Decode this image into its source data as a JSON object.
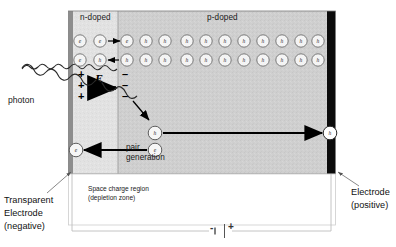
{
  "diagram": {
    "title_regions": {
      "n_doped": "n-doped",
      "p_doped": "p-doped"
    },
    "photon_label": "photon",
    "field_label": "E",
    "pair_generation_label_line1": "pair",
    "pair_generation_label_line2": "generation",
    "space_charge_line1": "Space charge region",
    "space_charge_line2": "(depletion zone)",
    "left_electrode": {
      "line1": "Transparent",
      "line2": "Electrode",
      "line3": "(negative)"
    },
    "right_electrode": {
      "line1": "Electrode",
      "line2": "(positive)"
    },
    "battery": {
      "negative": "-",
      "positive": "+"
    },
    "field_charges": {
      "positive_signs": [
        "+",
        "+",
        "+"
      ],
      "negative_signs": [
        "–",
        "–",
        "–"
      ]
    },
    "carriers_row1": [
      {
        "type": "e",
        "x": 80,
        "region": "n-doped"
      },
      {
        "type": "e",
        "x": 100,
        "region": "n-doped"
      },
      {
        "type": "e",
        "x": 127,
        "region": "p-doped"
      },
      {
        "type": "h",
        "x": 146,
        "region": "p-doped"
      },
      {
        "type": "h",
        "x": 165,
        "region": "p-doped"
      },
      {
        "type": "h",
        "x": 187,
        "region": "p-doped"
      },
      {
        "type": "h",
        "x": 206,
        "region": "p-doped"
      },
      {
        "type": "h",
        "x": 225,
        "region": "p-doped"
      },
      {
        "type": "h",
        "x": 244,
        "region": "p-doped"
      },
      {
        "type": "h",
        "x": 263,
        "region": "p-doped"
      },
      {
        "type": "h",
        "x": 282,
        "region": "p-doped"
      },
      {
        "type": "h",
        "x": 301,
        "region": "p-doped"
      },
      {
        "type": "h",
        "x": 317,
        "region": "p-doped"
      }
    ],
    "carriers_row2": [
      {
        "type": "e",
        "x": 80,
        "region": "n-doped"
      },
      {
        "type": "h",
        "x": 100,
        "region": "n-doped"
      },
      {
        "type": "h",
        "x": 127,
        "region": "p-doped"
      },
      {
        "type": "h",
        "x": 146,
        "region": "p-doped"
      },
      {
        "type": "h",
        "x": 165,
        "region": "p-doped"
      },
      {
        "type": "h",
        "x": 187,
        "region": "p-doped"
      },
      {
        "type": "h",
        "x": 206,
        "region": "p-doped"
      },
      {
        "type": "h",
        "x": 225,
        "region": "p-doped"
      },
      {
        "type": "h",
        "x": 244,
        "region": "p-doped"
      },
      {
        "type": "h",
        "x": 263,
        "region": "p-doped"
      },
      {
        "type": "h",
        "x": 282,
        "region": "p-doped"
      },
      {
        "type": "h",
        "x": 301,
        "region": "p-doped"
      },
      {
        "type": "h",
        "x": 317,
        "region": "p-doped"
      }
    ],
    "generated_pair": {
      "hole": "h",
      "electron": "e",
      "collected_electron": "e",
      "collected_hole": "h"
    },
    "colors": {
      "n_doped_fill": "#e4e4e4",
      "p_doped_fill": "#cfcfcf",
      "left_electrode": "#8f8f8f",
      "right_electrode": "#0a0a0a",
      "outline": "#6e6e6e",
      "text": "#1a1a1a",
      "wire": "#b8b8b8",
      "arrow": "#000000"
    }
  }
}
